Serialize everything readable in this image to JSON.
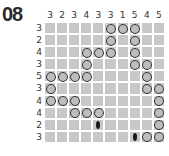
{
  "puzzle": {
    "number": "08",
    "col_clues": [
      "3",
      "2",
      "3",
      "4",
      "3",
      "3",
      "1",
      "5",
      "4",
      "5"
    ],
    "row_clues": [
      "3",
      "2",
      "4",
      "3",
      "5",
      "3",
      "4",
      "4",
      "2",
      "3"
    ],
    "grid": [
      [
        0,
        0,
        0,
        0,
        0,
        1,
        1,
        1,
        0,
        0
      ],
      [
        0,
        0,
        0,
        0,
        0,
        1,
        0,
        1,
        0,
        0
      ],
      [
        0,
        0,
        0,
        1,
        1,
        1,
        0,
        1,
        0,
        0
      ],
      [
        0,
        0,
        0,
        1,
        0,
        0,
        0,
        1,
        1,
        0
      ],
      [
        1,
        1,
        1,
        1,
        0,
        0,
        0,
        0,
        1,
        0
      ],
      [
        1,
        0,
        0,
        0,
        0,
        0,
        0,
        0,
        1,
        1
      ],
      [
        1,
        1,
        1,
        0,
        0,
        0,
        0,
        0,
        0,
        1
      ],
      [
        0,
        0,
        1,
        1,
        1,
        0,
        0,
        0,
        0,
        1
      ],
      [
        0,
        0,
        0,
        0,
        2,
        0,
        0,
        0,
        0,
        1
      ],
      [
        0,
        0,
        0,
        0,
        0,
        0,
        0,
        2,
        1,
        1
      ]
    ],
    "legend": {
      "0": "empty",
      "1": "circle",
      "2": "dark-mark"
    }
  }
}
